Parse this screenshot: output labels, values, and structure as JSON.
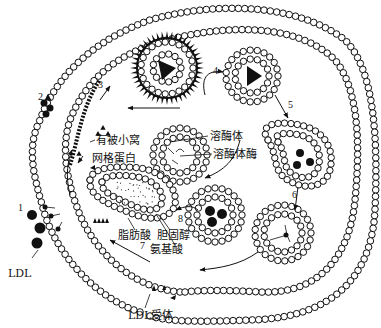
{
  "diagram": {
    "step_numbers": [
      "1",
      "2",
      "3",
      "4",
      "5",
      "6",
      "7",
      "8"
    ],
    "labels": {
      "coated_pit": "有被小窝",
      "clathrin": "网格蛋白",
      "lysosome": "溶酶体",
      "lysosomal_enzyme": "溶酶体酶",
      "fatty_acid": "脂肪酸",
      "cholesterol": "胆固醇",
      "amino_acid": "氨基酸",
      "ldl": "LDL",
      "ldl_receptor": "LDL受体"
    },
    "colors": {
      "line": "#111111",
      "bead_fill": "#ffffff",
      "background": "#ffffff"
    }
  }
}
